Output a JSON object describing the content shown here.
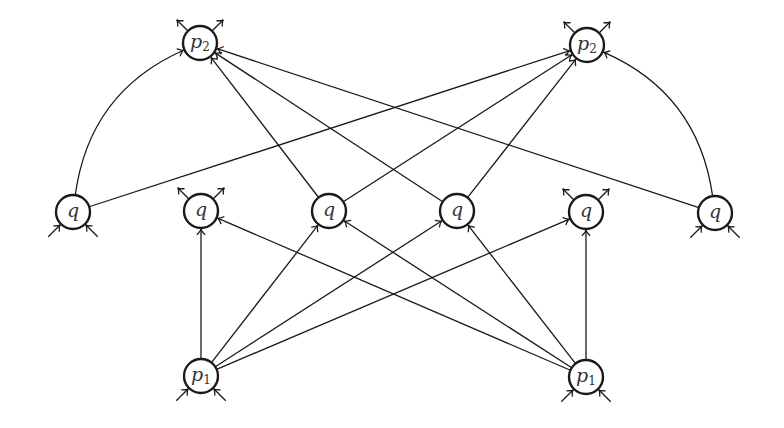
{
  "diagram": {
    "node_radius": 17,
    "colors": {
      "stroke": "#1a1a1a",
      "label": "#333333",
      "background": "#ffffff"
    },
    "nodes": [
      {
        "id": "p2_left",
        "label": "p",
        "sub": "2",
        "x": 200,
        "y": 43,
        "stubs": {
          "out_top": true,
          "in_bottom": false
        }
      },
      {
        "id": "p2_right",
        "label": "p",
        "sub": "2",
        "x": 587,
        "y": 45,
        "stubs": {
          "out_top": true,
          "in_bottom": false
        }
      },
      {
        "id": "q1",
        "label": "q",
        "sub": "",
        "x": 73,
        "y": 212,
        "stubs": {
          "out_top": false,
          "in_bottom": true
        }
      },
      {
        "id": "q2",
        "label": "q",
        "sub": "",
        "x": 201,
        "y": 211,
        "stubs": {
          "out_top": true,
          "in_bottom": false
        }
      },
      {
        "id": "q3",
        "label": "q",
        "sub": "",
        "x": 329,
        "y": 211,
        "stubs": {
          "out_top": false,
          "in_bottom": false
        }
      },
      {
        "id": "q4",
        "label": "q",
        "sub": "",
        "x": 457,
        "y": 211,
        "stubs": {
          "out_top": false,
          "in_bottom": false
        }
      },
      {
        "id": "q5",
        "label": "q",
        "sub": "",
        "x": 586,
        "y": 212,
        "stubs": {
          "out_top": true,
          "in_bottom": false
        }
      },
      {
        "id": "q6",
        "label": "q",
        "sub": "",
        "x": 715,
        "y": 213,
        "stubs": {
          "out_top": false,
          "in_bottom": true
        }
      },
      {
        "id": "p1_left",
        "label": "p",
        "sub": "1",
        "x": 201,
        "y": 376,
        "stubs": {
          "out_top": false,
          "in_bottom": true
        }
      },
      {
        "id": "p1_right",
        "label": "p",
        "sub": "1",
        "x": 586,
        "y": 377,
        "stubs": {
          "out_top": false,
          "in_bottom": true
        }
      }
    ],
    "edges": [
      {
        "from": "p1_left",
        "to": "q2",
        "curve": 0
      },
      {
        "from": "p1_left",
        "to": "q3",
        "curve": 0
      },
      {
        "from": "p1_left",
        "to": "q4",
        "curve": 0
      },
      {
        "from": "p1_left",
        "to": "q5",
        "curve": 0
      },
      {
        "from": "p1_right",
        "to": "q2",
        "curve": 0
      },
      {
        "from": "p1_right",
        "to": "q3",
        "curve": 0
      },
      {
        "from": "p1_right",
        "to": "q4",
        "curve": 0
      },
      {
        "from": "p1_right",
        "to": "q5",
        "curve": 0
      },
      {
        "from": "q1",
        "to": "p2_left",
        "curve": -0.28
      },
      {
        "from": "q1",
        "to": "p2_right",
        "curve": 0
      },
      {
        "from": "q3",
        "to": "p2_left",
        "curve": 0
      },
      {
        "from": "q3",
        "to": "p2_right",
        "curve": 0
      },
      {
        "from": "q4",
        "to": "p2_left",
        "curve": 0
      },
      {
        "from": "q4",
        "to": "p2_right",
        "curve": 0
      },
      {
        "from": "q6",
        "to": "p2_left",
        "curve": 0
      },
      {
        "from": "q6",
        "to": "p2_right",
        "curve": 0.28
      }
    ]
  }
}
